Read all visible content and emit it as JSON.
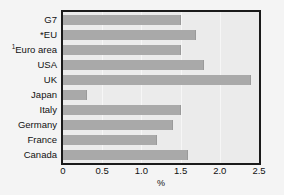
{
  "chart_data": {
    "type": "bar",
    "orientation": "horizontal",
    "title": "",
    "subtitle": "",
    "xlabel": "%",
    "ylabel": "",
    "xlim": [
      0,
      2.5
    ],
    "xticks": [
      "0",
      "0.5",
      "1.0",
      "1.5",
      "2.0",
      "2.5"
    ],
    "xtick_values": [
      0,
      0.5,
      1.0,
      1.5,
      2.0,
      2.5
    ],
    "grid": false,
    "legend": "none",
    "bar_color": "#a9a9a9",
    "plot_background": "#ebebeb",
    "frame_color": "#1a1a1a",
    "categories": [
      "G7",
      "*EU",
      "Euro area",
      "USA",
      "UK",
      "Japan",
      "Italy",
      "Germany",
      "France",
      "Canada"
    ],
    "category_labels": [
      {
        "text": "G7",
        "superscript": ""
      },
      {
        "text": "*EU",
        "superscript": ""
      },
      {
        "text": "Euro area",
        "superscript": "1"
      },
      {
        "text": "USA",
        "superscript": ""
      },
      {
        "text": "UK",
        "superscript": ""
      },
      {
        "text": "Japan",
        "superscript": ""
      },
      {
        "text": "Italy",
        "superscript": ""
      },
      {
        "text": "Germany",
        "superscript": ""
      },
      {
        "text": "France",
        "superscript": ""
      },
      {
        "text": "Canada",
        "superscript": ""
      }
    ],
    "values": [
      1.5,
      1.7,
      1.5,
      1.8,
      2.4,
      0.3,
      1.5,
      1.4,
      1.2,
      1.6
    ]
  }
}
